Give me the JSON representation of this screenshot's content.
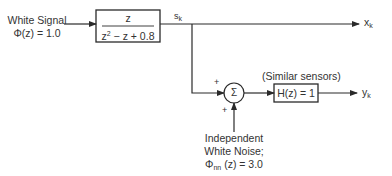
{
  "diagram": {
    "input": {
      "line1": "White Signal",
      "line2": "Φ(z) = 1.0"
    },
    "filter_block": {
      "numerator": "z",
      "denominator_z": "z",
      "denominator_exp": "2",
      "denominator_rest": " − z + 0.8"
    },
    "signal_label": {
      "base": "s",
      "sub": "k"
    },
    "output_x": {
      "base": "x",
      "sub": "k"
    },
    "summing_junction": {
      "symbol": "Σ",
      "plus_top": "+",
      "plus_bottom": "+"
    },
    "sensor_caption": "(Similar sensors)",
    "sensor_block": {
      "label": "H(z) = 1"
    },
    "output_y": {
      "base": "y",
      "sub": "k"
    },
    "noise": {
      "line1": "Independent",
      "line2": "White Noise;",
      "line3_phi": "Φ",
      "line3_sub": "nn",
      "line3_rest": " (z) = 3.0"
    }
  }
}
